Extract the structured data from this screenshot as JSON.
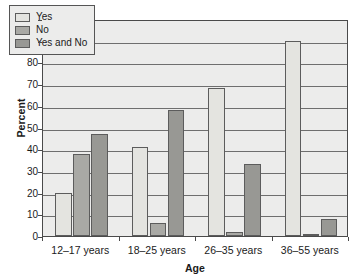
{
  "chart_data": {
    "type": "bar",
    "title": "",
    "xlabel": "Age",
    "ylabel": "Percent",
    "categories": [
      "12–17 years",
      "18–25 years",
      "26–35 years",
      "36–55 years"
    ],
    "series": [
      {
        "name": "Yes",
        "values": [
          20,
          41,
          68,
          90
        ]
      },
      {
        "name": "No",
        "values": [
          38,
          6,
          2,
          1
        ]
      },
      {
        "name": "Yes and No",
        "values": [
          47,
          58,
          33,
          8
        ]
      }
    ],
    "ylim": [
      0,
      100
    ],
    "ytick_values": [
      0,
      10,
      20,
      30,
      40,
      50,
      60,
      70,
      80,
      90,
      100
    ],
    "ytick_labels": [
      "0",
      "10",
      "20",
      "30",
      "40",
      "50",
      "60",
      "70",
      "80",
      "90",
      "100"
    ],
    "grid": true,
    "grid_axis": "y",
    "legend_position": "upper-left-inside",
    "colors": {
      "Yes": "#e4e4e0",
      "No": "#a9a9a5",
      "Yes and No": "#989894",
      "bar_outline": "#5c5c5c",
      "plot_background": "#ececeb",
      "gridline": "#6e6e6e",
      "axis": "#4a4a4a",
      "text": "#1a1a1a"
    }
  }
}
